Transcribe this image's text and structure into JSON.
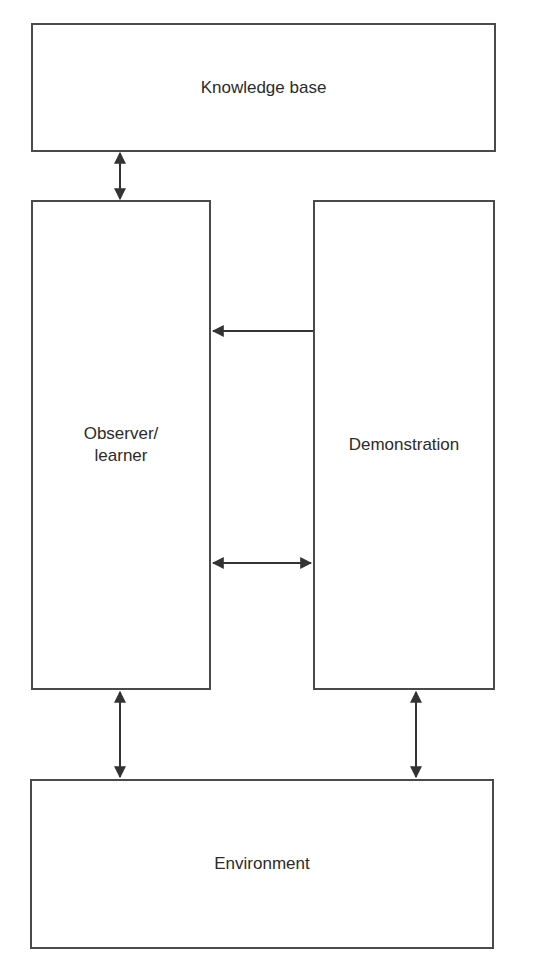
{
  "diagram": {
    "nodes": {
      "knowledge_base": {
        "label": "Knowledge base"
      },
      "observer": {
        "label": "Observer/\nlearner"
      },
      "demonstration": {
        "label": "Demonstration"
      },
      "environment": {
        "label": "Environment"
      }
    },
    "edges": [
      {
        "from": "knowledge_base",
        "to": "observer",
        "direction": "bidirectional"
      },
      {
        "from": "demonstration",
        "to": "observer",
        "direction": "one-way"
      },
      {
        "from": "observer",
        "to": "demonstration",
        "direction": "bidirectional"
      },
      {
        "from": "observer",
        "to": "environment",
        "direction": "bidirectional"
      },
      {
        "from": "demonstration",
        "to": "environment",
        "direction": "bidirectional"
      }
    ],
    "colors": {
      "stroke": "#4a4a4a",
      "text": "#2b2b2b",
      "background": "#ffffff"
    }
  }
}
